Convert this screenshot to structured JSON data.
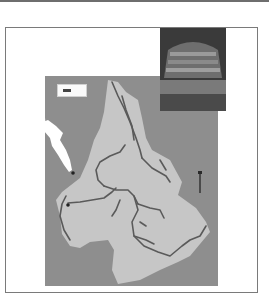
{
  "figure": {
    "type": "grayscale river basin map",
    "colors": {
      "background": "#ffffff",
      "frame": "#7a7a7a",
      "land_outside_basin": "#8e8e8e",
      "basin": "#c6c6c6",
      "water": "#ffffff",
      "rivers": "#5a5a5a",
      "points": "#222222"
    },
    "legend": {
      "label": ""
    },
    "photo_inset": {
      "description": "grayscale photo of a dam / spillway"
    },
    "north_arrow": {
      "description": "vertical scale bar / arrow"
    },
    "caption": {
      "text": ""
    },
    "markers": [
      {
        "name": "city-dot-1"
      },
      {
        "name": "city-dot-2"
      }
    ]
  }
}
